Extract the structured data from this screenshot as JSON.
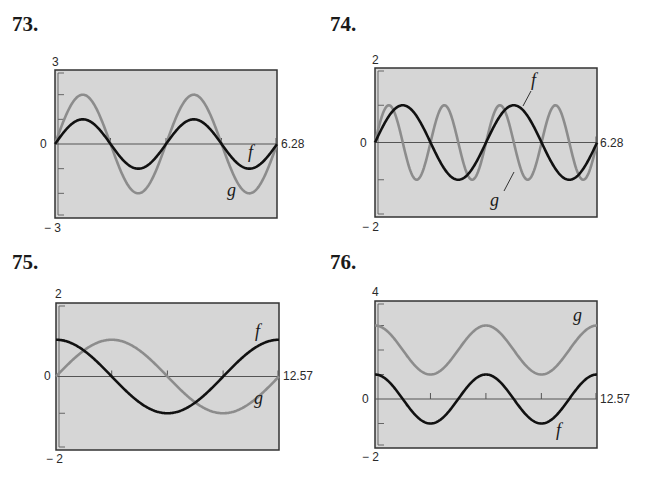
{
  "colors": {
    "background": "#ffffff",
    "plot_fill": "#d6d6d6",
    "frame": "#333333",
    "axis": "#555555",
    "f_curve": "#111111",
    "g_curve": "#8c8c8c"
  },
  "chart_data": [
    {
      "type": "line",
      "number": "73.",
      "xlim": [
        0,
        6.28
      ],
      "ylim": [
        -3,
        3
      ],
      "y_max_label": "3",
      "y_min_label": "− 3",
      "y_zero_label": "0",
      "x_max_label": "6.28",
      "yticks": [
        -2,
        -1,
        1,
        2
      ],
      "xticks": [
        1.57,
        3.14,
        4.71
      ],
      "series": [
        {
          "name": "f",
          "expr": "sin(2x)",
          "amp": 1,
          "freq": 2,
          "phase": "sin",
          "shift": 0
        },
        {
          "name": "g",
          "expr": "2sin(2x)",
          "amp": 2,
          "freq": 2,
          "phase": "sin",
          "shift": 0
        }
      ],
      "labels": {
        "f": "f",
        "g": "g"
      }
    },
    {
      "type": "line",
      "number": "74.",
      "xlim": [
        0,
        6.28
      ],
      "ylim": [
        -2,
        2
      ],
      "y_max_label": "2",
      "y_min_label": "− 2",
      "y_zero_label": "0",
      "x_max_label": "6.28",
      "yticks": [
        -1,
        1
      ],
      "xticks": [],
      "series": [
        {
          "name": "f",
          "expr": "sin(2x)",
          "amp": 1,
          "freq": 2,
          "phase": "sin",
          "shift": 0
        },
        {
          "name": "g",
          "expr": "sin(4x)",
          "amp": 1,
          "freq": 4,
          "phase": "sin",
          "shift": 0
        }
      ],
      "labels": {
        "f": "f",
        "g": "g"
      }
    },
    {
      "type": "line",
      "number": "75.",
      "xlim": [
        0,
        12.57
      ],
      "ylim": [
        -2,
        2
      ],
      "y_max_label": "2",
      "y_min_label": "− 2",
      "y_zero_label": "0",
      "x_max_label": "12.57",
      "yticks": [
        -1,
        1
      ],
      "xticks": [
        3.14,
        6.28,
        9.42
      ],
      "series": [
        {
          "name": "f",
          "expr": "cos(x/2)",
          "amp": 1,
          "freq": 0.5,
          "phase": "cos",
          "shift": 0
        },
        {
          "name": "g",
          "expr": "sin(x/2)",
          "amp": 1,
          "freq": 0.5,
          "phase": "sin",
          "shift": 0
        }
      ],
      "labels": {
        "f": "f",
        "g": "g"
      }
    },
    {
      "type": "line",
      "number": "76.",
      "xlim": [
        0,
        12.57
      ],
      "ylim": [
        -2,
        4
      ],
      "y_max_label": "4",
      "y_min_label": "− 2",
      "y_zero_label": "0",
      "x_max_label": "12.57",
      "yticks": [
        -1,
        1,
        2,
        3
      ],
      "xticks": [
        3.14,
        6.28,
        9.42
      ],
      "series": [
        {
          "name": "f",
          "expr": "cos(x)",
          "amp": 1,
          "freq": 1,
          "phase": "cos",
          "shift": 0
        },
        {
          "name": "g",
          "expr": "cos(x) + 2",
          "amp": 1,
          "freq": 1,
          "phase": "cos",
          "shift": 2
        }
      ],
      "labels": {
        "f": "f",
        "g": "g"
      }
    }
  ]
}
